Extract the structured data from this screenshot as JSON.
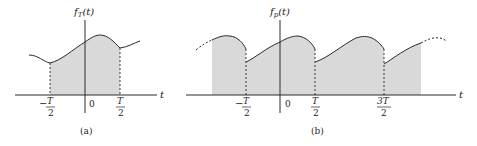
{
  "colors": {
    "fill": "#d9d9d9",
    "stroke": "#2a2a2a",
    "background": "#ffffff"
  },
  "panel_a": {
    "ylabel_main": "f",
    "ylabel_sub": "T",
    "ylabel_arg": "(t)",
    "xlabel": "t",
    "ticks": [
      {
        "minus": "−",
        "num": "T",
        "den": "2"
      },
      {
        "zero": "0"
      },
      {
        "num": "T",
        "den": "2"
      }
    ],
    "caption": "(a)"
  },
  "panel_b": {
    "ylabel_main": "f",
    "ylabel_sub": "p",
    "ylabel_arg": "(t)",
    "xlabel": "t",
    "ticks": [
      {
        "minus": "−",
        "num": "T",
        "den": "2"
      },
      {
        "zero": "0"
      },
      {
        "num": "T",
        "den": "2"
      },
      {
        "num": "3T",
        "den": "2"
      }
    ],
    "caption": "(b)"
  }
}
